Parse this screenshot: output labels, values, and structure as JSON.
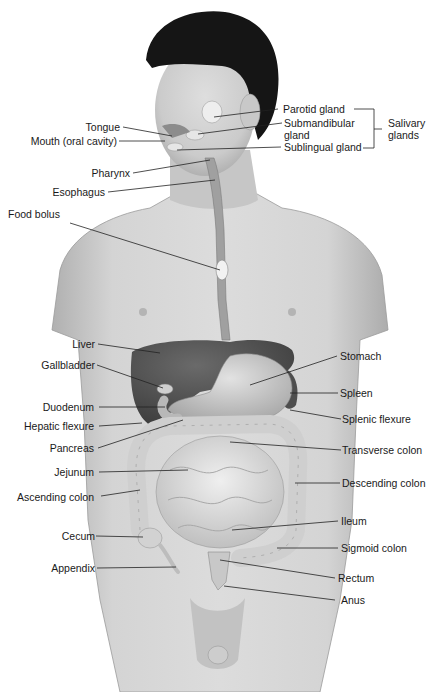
{
  "figure": {
    "style": "grayscale anatomical illustration",
    "colors": {
      "background": "#ffffff",
      "skin": "#d2d2d2",
      "skin_shadow": "#a9a9a9",
      "hair": "#111111",
      "liver": "#4a4a4a",
      "stomach": "#c4c4c4",
      "intestine": "#dcdcdc",
      "label_text": "#1a1a1a",
      "leader_line": "#222222"
    }
  },
  "labels_left": [
    {
      "id": "tongue",
      "text": "Tongue"
    },
    {
      "id": "mouth",
      "text": "Mouth (oral cavity)"
    },
    {
      "id": "pharynx",
      "text": "Pharynx"
    },
    {
      "id": "esophagus",
      "text": "Esophagus"
    },
    {
      "id": "food-bolus",
      "text": "Food bolus"
    },
    {
      "id": "liver",
      "text": "Liver"
    },
    {
      "id": "gallbladder",
      "text": "Gallbladder"
    },
    {
      "id": "duodenum",
      "text": "Duodenum"
    },
    {
      "id": "hepatic-flexure",
      "text": "Hepatic flexure"
    },
    {
      "id": "pancreas",
      "text": "Pancreas"
    },
    {
      "id": "jejunum",
      "text": "Jejunum"
    },
    {
      "id": "ascending-colon",
      "text": "Ascending colon"
    },
    {
      "id": "cecum",
      "text": "Cecum"
    },
    {
      "id": "appendix",
      "text": "Appendix"
    }
  ],
  "labels_right": [
    {
      "id": "parotid-gland",
      "text": "Parotid gland"
    },
    {
      "id": "submandibular-gland",
      "text": "Submandibular gland"
    },
    {
      "id": "sublingual-gland",
      "text": "Sublingual gland"
    },
    {
      "id": "stomach",
      "text": "Stomach"
    },
    {
      "id": "spleen",
      "text": "Spleen"
    },
    {
      "id": "splenic-flexure",
      "text": "Splenic flexure"
    },
    {
      "id": "transverse-colon",
      "text": "Transverse colon"
    },
    {
      "id": "descending-colon",
      "text": "Descending colon"
    },
    {
      "id": "ileum",
      "text": "Ileum"
    },
    {
      "id": "sigmoid-colon",
      "text": "Sigmoid colon"
    },
    {
      "id": "rectum",
      "text": "Rectum"
    },
    {
      "id": "anus",
      "text": "Anus"
    }
  ],
  "group_labels": [
    {
      "id": "salivary-glands",
      "text": "Salivary glands",
      "members": [
        "Parotid gland",
        "Submandibular gland",
        "Sublingual gland"
      ]
    }
  ]
}
